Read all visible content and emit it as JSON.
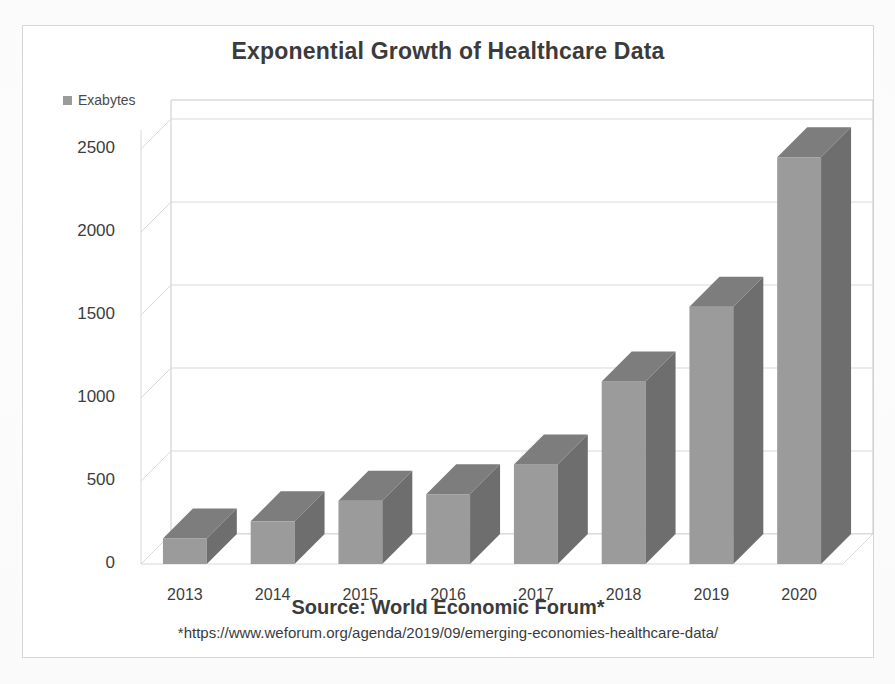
{
  "chart_data": {
    "type": "bar",
    "title": "Exponential Growth of Healthcare Data",
    "xlabel": "",
    "ylabel": "",
    "categories": [
      "2013",
      "2014",
      "2015",
      "2016",
      "2017",
      "2018",
      "2019",
      "2020"
    ],
    "values": [
      153,
      257,
      381,
      420,
      600,
      1100,
      1550,
      2450
    ],
    "series": [
      {
        "name": "Exabytes",
        "values": [
          153,
          257,
          381,
          420,
          600,
          1100,
          1550,
          2450
        ]
      }
    ],
    "legend": [
      "Exabytes"
    ],
    "legend_position": "top-left",
    "ylim": [
      0,
      2500
    ],
    "yticks": [
      0,
      500,
      1000,
      1500,
      2000,
      2500
    ],
    "ytick_labels": [
      "0",
      "500",
      "1000",
      "1500",
      "2000",
      "2500"
    ],
    "grid": true,
    "style": "3d-column",
    "colors": {
      "bar_front": "#9b9b9b",
      "bar_side": "#6e6e6e",
      "bar_top": "#7d7d7d",
      "gridline": "#d9d9d9",
      "axis": "#c9c9c9",
      "text": "#3b3b3b",
      "frame": "#d6d6d6",
      "background": "#ffffff"
    },
    "annotations": {
      "source": "Source: World Economic Forum*",
      "source_url": "*https://www.weforum.org/agenda/2019/09/emerging-economies-healthcare-data/"
    }
  },
  "chart": {
    "title": "Exponential Growth of Healthcare Data",
    "legend_label": "Exabytes",
    "legend_icon": "square-swatch-icon",
    "yticks": [
      "2500",
      "2000",
      "1500",
      "1000",
      "500",
      "0"
    ],
    "xticks": [
      "2013",
      "2014",
      "2015",
      "2016",
      "2017",
      "2018",
      "2019",
      "2020"
    ]
  },
  "footer": {
    "source": "Source: World Economic Forum*",
    "source_url": "*https://www.weforum.org/agenda/2019/09/emerging-economies-healthcare-data/"
  }
}
